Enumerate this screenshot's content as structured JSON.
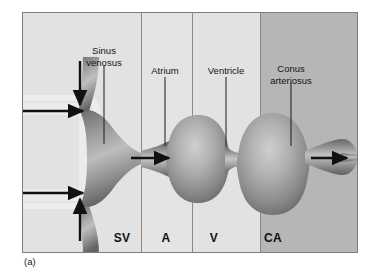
{
  "figure": {
    "caption": "(a)",
    "kind": "anatomical-diagram"
  },
  "colors": {
    "frame_border": "#7d7d7d",
    "panel_light": "#e2e2e2",
    "panel_light_alt": "#e4e4e4",
    "panel_dark": "#b6b6b6",
    "divider": "#8a8a8a",
    "tube_dark": "#6c6c6c",
    "tube_mid": "#8f8f8f",
    "tube_light": "#c3c3c3",
    "arrow": "#111111",
    "leader": "#1a1a1a",
    "vessel_fill": "#ececec",
    "text": "#141414"
  },
  "zones": [
    {
      "key": "sv",
      "abbrev": "SV",
      "name": "Sinus venosus",
      "label_x": 121,
      "x_start": 1,
      "x_end": 118,
      "shade": "light"
    },
    {
      "key": "a",
      "abbrev": "A",
      "name": "Atrium",
      "label_x": 165,
      "x_start": 118,
      "x_end": 169,
      "shade": "light"
    },
    {
      "key": "v",
      "abbrev": "V",
      "name": "Ventricle",
      "label_x": 213,
      "x_start": 169,
      "x_end": 237,
      "shade": "light"
    },
    {
      "key": "ca",
      "abbrev": "CA",
      "name": "Conus arteriosus",
      "label_x": 272,
      "x_start": 237,
      "x_end": 335,
      "shade": "dark"
    }
  ],
  "callouts": [
    {
      "key": "sinus-venosus",
      "line1": "Sinus",
      "line2": "venosus",
      "text_x": 103,
      "text_y": 30,
      "leader_x": 103,
      "leader_y": 60,
      "leader_len": 80
    },
    {
      "key": "atrium",
      "line1": "Atrium",
      "line2": "",
      "text_x": 164,
      "text_y": 57,
      "leader_x": 164,
      "leader_y": 72,
      "leader_len": 68
    },
    {
      "key": "ventricle",
      "line1": "Ventricle",
      "line2": "",
      "text_x": 225,
      "text_y": 57,
      "leader_x": 225,
      "leader_y": 72,
      "leader_len": 68
    },
    {
      "key": "conus-arteriosus",
      "line1": "Conus",
      "line2": "arteriosus",
      "text_x": 290,
      "text_y": 48,
      "leader_x": 290,
      "leader_y": 78,
      "leader_len": 62
    }
  ],
  "flow_arrows": [
    {
      "key": "inflow-upper",
      "direction": "right",
      "x1": 22,
      "y1": 110,
      "x2": 63,
      "y2": 110
    },
    {
      "key": "inflow-lower",
      "direction": "right",
      "x1": 22,
      "y1": 178,
      "x2": 63,
      "y2": 178
    },
    {
      "key": "inflow-top",
      "direction": "down",
      "x1": 68,
      "y1": 60,
      "x2": 68,
      "y2": 102
    },
    {
      "key": "inflow-bottom",
      "direction": "up",
      "x1": 68,
      "y1": 228,
      "x2": 68,
      "y2": 186
    },
    {
      "key": "sv-to-atrium",
      "direction": "right",
      "x1": 120,
      "y1": 145,
      "x2": 155,
      "y2": 145
    },
    {
      "key": "ca-outflow",
      "direction": "right",
      "x1": 296,
      "y1": 145,
      "x2": 332,
      "y2": 145
    }
  ],
  "labels_bottom_y": 226
}
